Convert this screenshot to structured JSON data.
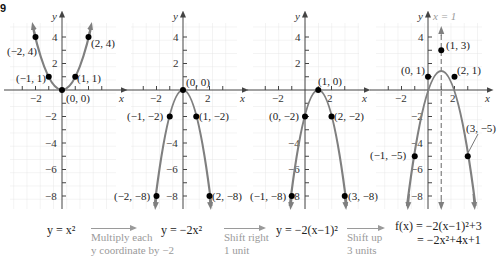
{
  "figure_label": "9",
  "colors": {
    "curve": "#7f7f7f",
    "point": "#000000",
    "grid": "#e4e4e4",
    "axis": "#444444",
    "step_text": "#9a9a9a",
    "dashed_axis": "#7f7f7f"
  },
  "axes": {
    "x_label": "x",
    "y_label": "y",
    "x_ticks": [
      "−2",
      "2"
    ],
    "y_ticks": [
      "4",
      "2",
      "−2",
      "−4",
      "−6",
      "−8"
    ]
  },
  "panels": [
    {
      "id": "panel-1",
      "equation": "y = x²",
      "points": [
        {
          "label": "(−2, 4)",
          "x": -2,
          "y": 4
        },
        {
          "label": "(−1, 1)",
          "x": -1,
          "y": 1
        },
        {
          "label": "(0, 0)",
          "x": 0,
          "y": 0
        },
        {
          "label": "(1, 1)",
          "x": 1,
          "y": 1
        },
        {
          "label": "(2, 4)",
          "x": 2,
          "y": 4
        }
      ]
    },
    {
      "id": "panel-2",
      "equation": "y = −2x²",
      "points": [
        {
          "label": "(0, 0)",
          "x": 0,
          "y": 0
        },
        {
          "label": "(−1, −2)",
          "x": -1,
          "y": -2
        },
        {
          "label": "(1, −2)",
          "x": 1,
          "y": -2
        },
        {
          "label": "(−2, −8)",
          "x": -2,
          "y": -8
        },
        {
          "label": "(2, −8)",
          "x": 2,
          "y": -8
        }
      ]
    },
    {
      "id": "panel-3",
      "equation": "y = −2(x−1)²",
      "points": [
        {
          "label": "(1, 0)",
          "x": 1,
          "y": 0
        },
        {
          "label": "(0, −2)",
          "x": 0,
          "y": -2
        },
        {
          "label": "(2, −2)",
          "x": 2,
          "y": -2
        },
        {
          "label": "(−1, −8)",
          "x": -1,
          "y": -8
        },
        {
          "label": "(3, −8)",
          "x": 3,
          "y": -8
        }
      ]
    },
    {
      "id": "panel-4",
      "equation_line1": "f(x) = −2(x−1)²+3",
      "equation_line2": "= −2x²+4x+1",
      "axis_of_symmetry": "x = 1",
      "points": [
        {
          "label": "(1, 3)",
          "x": 1,
          "y": 3
        },
        {
          "label": "(0, 1)",
          "x": 0,
          "y": 1
        },
        {
          "label": "(2, 1)",
          "x": 2,
          "y": 1
        },
        {
          "label": "(−1, −5)",
          "x": -1,
          "y": -5
        },
        {
          "label": "(3, −5)",
          "x": 3,
          "y": -5
        }
      ]
    }
  ],
  "transformations": [
    {
      "line1": "Multiply each",
      "line2": "y coordinate by −2"
    },
    {
      "line1": "Shift right",
      "line2": "1 unit"
    },
    {
      "line1": "Shift up",
      "line2": "3 units"
    }
  ]
}
